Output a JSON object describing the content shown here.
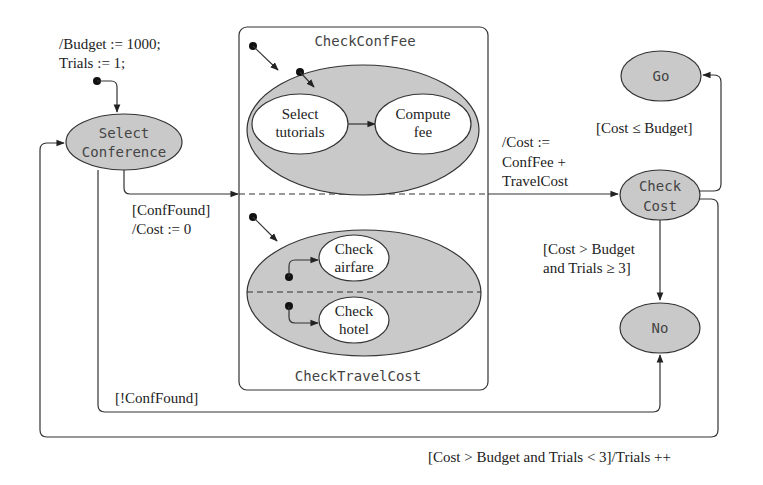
{
  "diagram": {
    "type": "UML state machine",
    "initial_action": {
      "line1": "/Budget := 1000;",
      "line2": "Trials := 1;"
    },
    "states": {
      "select_conference": {
        "line1": "Select",
        "line2": "Conference"
      },
      "go": {
        "label": "Go"
      },
      "check_cost": {
        "line1": "Check",
        "line2": "Cost"
      },
      "no": {
        "label": "No"
      }
    },
    "composite": {
      "region_top": {
        "name": "CheckConfFee",
        "substates": [
          {
            "line1": "Select",
            "line2": "tutorials"
          },
          {
            "line1": "Compute",
            "line2": "fee"
          }
        ]
      },
      "region_bottom": {
        "name": "CheckTravelCost",
        "substates": [
          {
            "line1": "Check",
            "line2": "airfare"
          },
          {
            "line1": "Check",
            "line2": "hotel"
          }
        ]
      }
    },
    "transitions": {
      "conf_found": {
        "line1": "[ConfFound]",
        "line2": "/Cost := 0"
      },
      "to_check_cost": {
        "line1": "/Cost :=",
        "line2": "ConfFee +",
        "line3": "TravelCost"
      },
      "cost_ok": {
        "label": "[Cost ≤ Budget]"
      },
      "cost_fail_final": {
        "line1": "[Cost > Budget",
        "line2": "and Trials ≥ 3]"
      },
      "not_found": {
        "label": "[!ConfFound]"
      },
      "retry": {
        "label": "[Cost > Budget and Trials < 3]/Trials ++"
      }
    }
  }
}
